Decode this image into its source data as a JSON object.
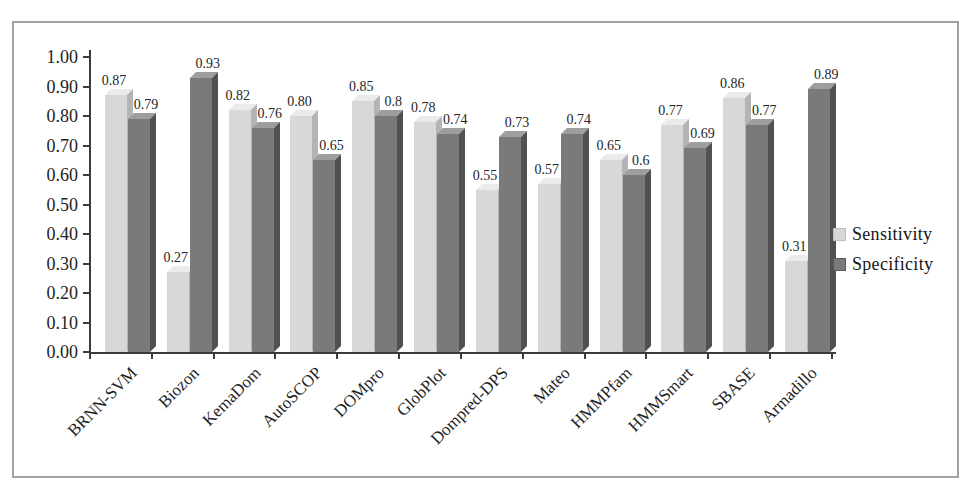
{
  "chart_data": {
    "type": "bar",
    "title": "",
    "xlabel": "",
    "ylabel": "",
    "categories": [
      "BRNN-SVM",
      "Biozon",
      "KemaDom",
      "AutoSCOP",
      "DOMpro",
      "GlobPlot",
      "Dompred-DPS",
      "Mateo",
      "HMMPfam",
      "HMMSmart",
      "SBASE",
      "Armadillo"
    ],
    "series": [
      {
        "name": "Sensitivity",
        "values": [
          0.87,
          0.27,
          0.82,
          0.8,
          0.85,
          0.78,
          0.55,
          0.57,
          0.65,
          0.77,
          0.86,
          0.31
        ],
        "labels": [
          "0.87",
          "0.27",
          "0.82",
          "0.80",
          "0.85",
          "0.78",
          "0.55",
          "0.57",
          "0.65",
          "0.77",
          "0.86",
          "0.31"
        ]
      },
      {
        "name": "Specificity",
        "values": [
          0.79,
          0.93,
          0.76,
          0.65,
          0.8,
          0.74,
          0.73,
          0.74,
          0.6,
          0.69,
          0.77,
          0.89
        ],
        "labels": [
          "0.79",
          "0.93",
          "0.76",
          "0.65",
          "0.8",
          "0.74",
          "0.73",
          "0.74",
          "0.6",
          "0.69",
          "0.77",
          "0.89"
        ]
      }
    ],
    "ylim": [
      0.0,
      1.0
    ],
    "yticks": [
      "1.00",
      "0.90",
      "0.80",
      "0.70",
      "0.60",
      "0.50",
      "0.40",
      "0.30",
      "0.20",
      "0.10",
      "0.00"
    ],
    "grid": false,
    "legend_position": "middle-right",
    "bar_style": "3d-clustered",
    "data_labels": true,
    "category_label_rotation_deg": -45
  },
  "colors": {
    "sensitivity_face": "#d8d8d8",
    "sensitivity_top": "#ebebeb",
    "sensitivity_side": "#b4b4b4",
    "specificity_face": "#7a7a7a",
    "specificity_top": "#9e9e9e",
    "specificity_side": "#515151",
    "axis": "#3c3c3c",
    "frame_border": "#a3a3a3",
    "background": "#ffffff"
  }
}
